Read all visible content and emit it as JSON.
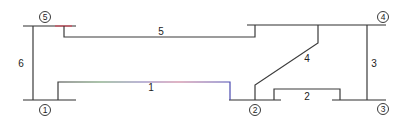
{
  "diagram": {
    "type": "power-system-single-line",
    "buses": [
      {
        "id": "1",
        "label": "1",
        "x1": 23,
        "x2": 76,
        "y": 100,
        "label_x": 45,
        "label_y": 110
      },
      {
        "id": "2",
        "label": "2",
        "x1": 229,
        "x2": 281,
        "y": 100,
        "label_x": 255,
        "label_y": 110
      },
      {
        "id": "3",
        "label": "3",
        "x1": 332,
        "x2": 386,
        "y": 100,
        "label_x": 383,
        "label_y": 109
      },
      {
        "id": "4",
        "label": "4",
        "x1": 247,
        "x2": 386,
        "y": 25,
        "label_x": 383,
        "label_y": 17
      },
      {
        "id": "5",
        "label": "5",
        "x1": 23,
        "x2": 76,
        "y": 26,
        "label_x": 45,
        "label_y": 17
      }
    ],
    "lines": [
      {
        "id": "1",
        "label": "1",
        "from": "1",
        "to": "2",
        "label_x": 151,
        "label_y": 89
      },
      {
        "id": "2",
        "label": "2",
        "from": "2",
        "to": "3",
        "label_x": 307,
        "label_y": 99
      },
      {
        "id": "3",
        "label": "3",
        "from": "3",
        "to": "4",
        "label_x": 374,
        "label_y": 66
      },
      {
        "id": "4",
        "label": "4",
        "from": "2",
        "to": "4",
        "label_x": 306,
        "label_y": 60
      },
      {
        "id": "5",
        "label": "5",
        "from": "5",
        "to": "4",
        "label_x": 161,
        "label_y": 34
      },
      {
        "id": "6",
        "label": "6",
        "from": "1",
        "to": "5",
        "label_x": 21,
        "label_y": 67
      }
    ]
  },
  "colors": {
    "line": "#3a3a3a",
    "bus": "#2f2f2f",
    "accent_red": "#d44a5a",
    "accent_blue": "#4a5ad4",
    "accent_green": "#5a9a5a"
  }
}
